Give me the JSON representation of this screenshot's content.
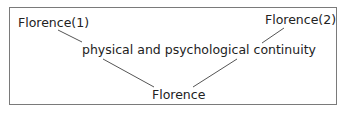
{
  "diagram": {
    "nodes": {
      "top_left": "Florence(1)",
      "top_right": "Florence(2)",
      "middle": "physical and psychological continuity",
      "bottom": "Florence"
    },
    "edges": [
      {
        "from": "top_left",
        "to": "middle"
      },
      {
        "from": "top_right",
        "to": "middle"
      },
      {
        "from": "middle",
        "to": "bottom"
      },
      {
        "from": "middle",
        "to": "bottom"
      }
    ]
  }
}
